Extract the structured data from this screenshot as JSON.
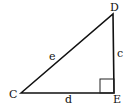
{
  "diagram": {
    "type": "right-triangle",
    "vertices": [
      {
        "label": "C",
        "x": 21,
        "y": 93
      },
      {
        "label": "D",
        "x": 113,
        "y": 14
      },
      {
        "label": "E",
        "x": 114,
        "y": 93
      }
    ],
    "sides": [
      {
        "label": "e",
        "from": "C",
        "to": "D"
      },
      {
        "label": "c",
        "from": "D",
        "to": "E"
      },
      {
        "label": "d",
        "from": "C",
        "to": "E"
      }
    ],
    "right_angle_at": "E"
  },
  "labels": {
    "C": "C",
    "D": "D",
    "E": "E",
    "c": "c",
    "d": "d",
    "e": "e"
  }
}
